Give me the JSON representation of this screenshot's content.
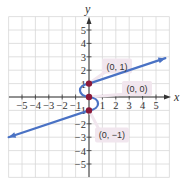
{
  "chart_data": {
    "type": "line",
    "title": "",
    "xlabel": "x",
    "ylabel": "y",
    "xlim": [
      -6,
      6
    ],
    "ylim": [
      -6,
      6
    ],
    "grid": true,
    "x_ticks": [
      -5,
      -4,
      -3,
      -2,
      -1,
      1,
      2,
      3,
      4,
      5
    ],
    "y_ticks": [
      -5,
      -4,
      -3,
      -2,
      -1,
      1,
      2,
      3,
      4,
      5
    ],
    "x_tick_labels": [
      "−5",
      "−4",
      "−3",
      "−2",
      "−1",
      "1",
      "2",
      "3",
      "4",
      "5"
    ],
    "y_tick_labels": [
      "−5",
      "−4",
      "−3",
      "−2",
      "−1",
      "1",
      "2",
      "3",
      "4",
      "5"
    ],
    "series": [
      {
        "name": "curve",
        "color": "#4a72c4",
        "description": "Line with arrow from lower-left to (0,-1), S-shaped curve through (0,-1), (0,0), (0,1), then line with arrow to upper-right",
        "points": [
          [
            -6,
            -3
          ],
          [
            0,
            -1
          ],
          [
            0.7,
            -0.5
          ],
          [
            0,
            0
          ],
          [
            -0.7,
            0.5
          ],
          [
            0,
            1
          ],
          [
            5.7,
            2.9
          ]
        ]
      }
    ],
    "marked_points": [
      {
        "x": 0,
        "y": 1,
        "label": "(0, 1)",
        "color": "#8b1a3a"
      },
      {
        "x": 0,
        "y": 0,
        "label": "(0, 0)",
        "color": "#8b1a3a"
      },
      {
        "x": 0,
        "y": -1,
        "label": "(0, −1)",
        "color": "#8b1a3a"
      }
    ],
    "annotations": [
      "(0, 1)",
      "(0, 0)",
      "(0, −1)"
    ]
  },
  "colors": {
    "grid": "#d8d8d8",
    "axis": "#333333",
    "curve": "#4a72c4",
    "point": "#8b1a3a",
    "label_bg": "#f1e6ee"
  }
}
